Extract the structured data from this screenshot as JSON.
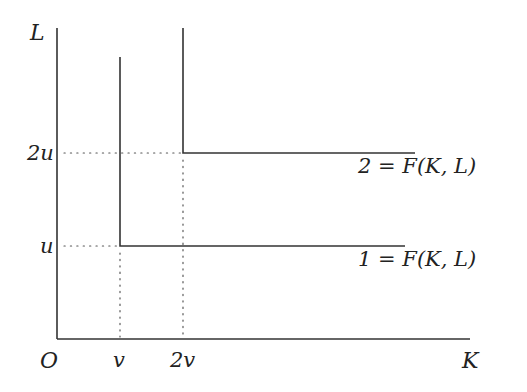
{
  "diagram": {
    "type": "isoquant-leontief",
    "axes": {
      "origin_label": "O",
      "x_label": "K",
      "y_label": "L"
    },
    "ticks": {
      "x": [
        "v",
        "2v"
      ],
      "y": [
        "u",
        "2u"
      ]
    },
    "isoquants": [
      {
        "level": "1",
        "label": "1 = F(K, L)",
        "corner": {
          "K": "v",
          "L": "u"
        }
      },
      {
        "level": "2",
        "label": "2 = F(K, L)",
        "corner": {
          "K": "2v",
          "L": "2u"
        }
      }
    ],
    "colors": {
      "line": "#333333",
      "dotted": "#555555",
      "text": "#222222",
      "background": "#ffffff"
    }
  }
}
